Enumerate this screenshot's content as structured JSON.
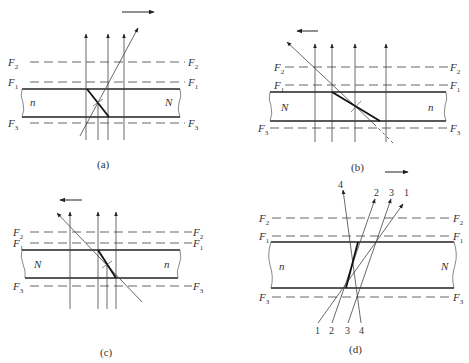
{
  "figure": {
    "panels": [
      {
        "id": "a",
        "caption": "(a)",
        "left_medium": "n",
        "right_medium": "N",
        "lines": {
          "top": "F2",
          "middle": "F1",
          "bottom": "F3"
        },
        "motion_direction": "right"
      },
      {
        "id": "b",
        "caption": "(b)",
        "left_medium": "N",
        "right_medium": "n",
        "lines": {
          "top": "F2",
          "middle": "F1",
          "bottom": "F3"
        },
        "motion_direction": "left"
      },
      {
        "id": "c",
        "caption": "(c)",
        "left_medium": "N",
        "right_medium": "n",
        "lines": {
          "top": "F2",
          "middle": "F1",
          "bottom": "F3"
        },
        "motion_direction": "left"
      },
      {
        "id": "d",
        "caption": "(d)",
        "left_medium": "n",
        "right_medium": "N",
        "lines": {
          "top": "F2",
          "middle": "F1",
          "bottom": "F3"
        },
        "motion_direction": "right",
        "ray_labels_top": [
          "4",
          "2",
          "3",
          "1"
        ],
        "ray_labels_bottom": [
          "1",
          "2",
          "3",
          "4"
        ]
      }
    ],
    "labels": {
      "F": "F",
      "sub1": "1",
      "sub2": "2",
      "sub3": "3"
    }
  }
}
